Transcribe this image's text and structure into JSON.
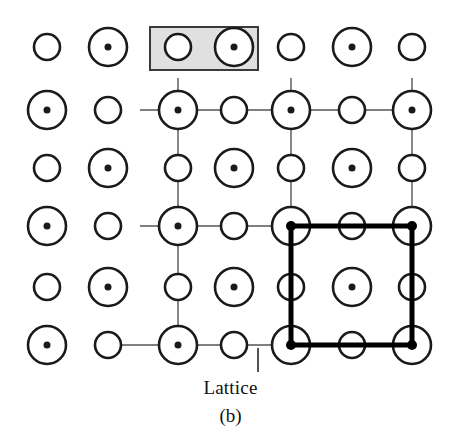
{
  "figure": {
    "panel_label": "(b)",
    "annotation_label": "Lattice",
    "background_color": "#ffffff",
    "ink_color": "#1a1a1a",
    "lattice_line_color": "#555555",
    "unit_cell_color": "#000000",
    "basis_box_fill": "#e0e0e0",
    "basis_box_stroke": "#3a3a3a",
    "width": 461,
    "height": 440
  },
  "chart_data": {
    "type": "scatter",
    "title": "(b)",
    "subtitle": "Two-dimensional crystal structure: lattice plus two-atom basis",
    "xlabel": "",
    "ylabel": "",
    "grid": true,
    "legend_position": "none",
    "annotations": [
      {
        "text": "Lattice",
        "x": 240,
        "y": 390,
        "leader_line": {
          "x1": 258,
          "y1": 348,
          "x2": 258,
          "y2": 372
        }
      },
      {
        "text": "(b)",
        "x": 230,
        "y": 418
      }
    ],
    "columns_x": [
      47,
      108,
      178,
      234,
      291,
      352,
      412
    ],
    "rows_y": [
      47,
      110,
      168,
      226,
      287,
      345
    ],
    "atom_radius_large": 19,
    "atom_radius_small": 13,
    "atom_center_dot_radius": 3.5,
    "series": [
      {
        "name": "large-atom-with-center-dot",
        "marker": "circle-with-dot",
        "radius": 19,
        "points": [
          {
            "x": 108,
            "y": 47
          },
          {
            "x": 234,
            "y": 47
          },
          {
            "x": 352,
            "y": 47
          },
          {
            "x": 47,
            "y": 110
          },
          {
            "x": 178,
            "y": 110
          },
          {
            "x": 291,
            "y": 110
          },
          {
            "x": 412,
            "y": 110
          },
          {
            "x": 108,
            "y": 168
          },
          {
            "x": 234,
            "y": 168
          },
          {
            "x": 352,
            "y": 168
          },
          {
            "x": 47,
            "y": 226
          },
          {
            "x": 178,
            "y": 226
          },
          {
            "x": 291,
            "y": 226
          },
          {
            "x": 412,
            "y": 226
          },
          {
            "x": 108,
            "y": 287
          },
          {
            "x": 234,
            "y": 287
          },
          {
            "x": 352,
            "y": 287
          },
          {
            "x": 47,
            "y": 345
          },
          {
            "x": 178,
            "y": 345
          },
          {
            "x": 291,
            "y": 345
          },
          {
            "x": 412,
            "y": 345
          }
        ]
      },
      {
        "name": "small-atom",
        "marker": "circle",
        "radius": 13,
        "points": [
          {
            "x": 47,
            "y": 47
          },
          {
            "x": 178,
            "y": 47
          },
          {
            "x": 291,
            "y": 47
          },
          {
            "x": 412,
            "y": 47
          },
          {
            "x": 108,
            "y": 110
          },
          {
            "x": 234,
            "y": 110
          },
          {
            "x": 352,
            "y": 110
          },
          {
            "x": 47,
            "y": 168
          },
          {
            "x": 178,
            "y": 168
          },
          {
            "x": 291,
            "y": 168
          },
          {
            "x": 412,
            "y": 168
          },
          {
            "x": 108,
            "y": 226
          },
          {
            "x": 234,
            "y": 226
          },
          {
            "x": 352,
            "y": 226
          },
          {
            "x": 47,
            "y": 287
          },
          {
            "x": 178,
            "y": 287
          },
          {
            "x": 291,
            "y": 287
          },
          {
            "x": 412,
            "y": 287
          },
          {
            "x": 108,
            "y": 345
          },
          {
            "x": 234,
            "y": 345
          },
          {
            "x": 352,
            "y": 345
          }
        ]
      }
    ],
    "lattice_lines": {
      "stroke_width": 1.4,
      "horizontal": [
        {
          "y": 110,
          "x1": 140,
          "x2": 430
        },
        {
          "y": 226,
          "x1": 140,
          "x2": 430
        },
        {
          "y": 345,
          "x1": 105,
          "x2": 430
        }
      ],
      "vertical": [
        {
          "x": 178,
          "y1": 78,
          "y2": 363
        },
        {
          "x": 291,
          "y1": 78,
          "y2": 363
        },
        {
          "x": 412,
          "y1": 78,
          "y2": 363
        }
      ]
    },
    "unit_cell": {
      "label": "primitive unit cell",
      "stroke_width": 5,
      "x": 291,
      "y": 226,
      "width": 121,
      "height": 119,
      "corner_nodes": [
        {
          "x": 291,
          "y": 226
        },
        {
          "x": 412,
          "y": 226
        },
        {
          "x": 291,
          "y": 345
        },
        {
          "x": 412,
          "y": 345
        }
      ],
      "node_radius": 5
    },
    "basis_box": {
      "label": "basis",
      "x": 150,
      "y": 27,
      "width": 108,
      "height": 43,
      "contains_atoms": [
        "small-atom",
        "large-atom-with-center-dot"
      ]
    }
  }
}
